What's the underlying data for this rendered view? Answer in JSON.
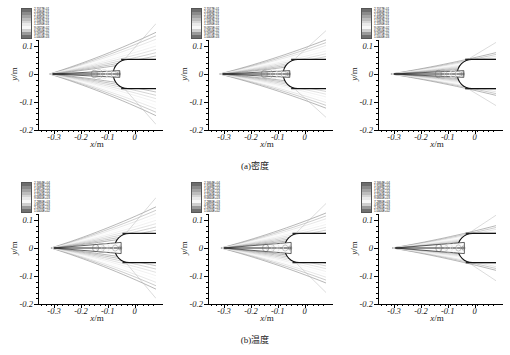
{
  "figure": {
    "width": 510,
    "height": 355,
    "background": "#ffffff"
  },
  "axes": {
    "xlabel_var": "x",
    "xlabel_unit": "/m",
    "ylabel_var": "y",
    "ylabel_unit": "/m",
    "xticks": [
      "-0.3",
      "-0.2",
      "-0.1",
      "0"
    ],
    "xtick_values": [
      -0.3,
      -0.2,
      -0.1,
      0
    ],
    "yticks": [
      "0.2",
      "0.1",
      "0",
      "-0.1",
      "-0.2"
    ],
    "ytick_values": [
      0.2,
      0.1,
      0,
      -0.1,
      -0.2
    ],
    "xlim": [
      -0.36,
      0.08
    ],
    "ylim": [
      -0.2,
      0.2
    ]
  },
  "rows": [
    {
      "id": "row-density",
      "caption": "(a)密度",
      "quantity": "density",
      "legend_levels": [
        "2.7077E-01",
        "2.4080E-01",
        "2.1082E-01",
        "1.8085E-01",
        "1.5087E-01",
        "1.2090E-01",
        "9.0925E-02",
        "6.0950E-02",
        "3.0975E-02",
        "1.0000E-03"
      ],
      "legend_values": [
        0.27077,
        0.2408,
        0.21082,
        0.18085,
        0.15087,
        0.1209,
        0.090925,
        0.06095,
        0.030975,
        0.001
      ]
    },
    {
      "id": "row-temperature",
      "caption": "(b)温度",
      "quantity": "temperature",
      "legend_levels": [
        "2.1664E+04",
        "1.9248E+04",
        "1.6872E+04",
        "1.4476E+04",
        "1.2080E+04",
        "9.6840E+03",
        "7.2880E+03",
        "4.8920E+03",
        "2.4960E+03",
        "1.0000E+02"
      ],
      "legend_values": [
        21664,
        19248,
        16872,
        14476,
        12080,
        9684,
        7288,
        4892,
        2496,
        100
      ]
    }
  ],
  "panels": [
    {
      "id": "panel-a1",
      "row": "density",
      "column": 1,
      "shock_spread": 1.0,
      "shock_tip_x": -0.305,
      "body_nose_x": -0.055
    },
    {
      "id": "panel-a2",
      "row": "density",
      "column": 2,
      "shock_spread": 0.82,
      "shock_tip_x": -0.305,
      "body_nose_x": -0.055
    },
    {
      "id": "panel-a3",
      "row": "density",
      "column": 3,
      "shock_spread": 0.52,
      "shock_tip_x": -0.3,
      "body_nose_x": -0.04
    },
    {
      "id": "panel-b1",
      "row": "temperature",
      "column": 1,
      "shock_spread": 1.0,
      "shock_tip_x": -0.3,
      "body_nose_x": -0.05
    },
    {
      "id": "panel-b2",
      "row": "temperature",
      "column": 2,
      "shock_spread": 0.85,
      "shock_tip_x": -0.3,
      "body_nose_x": -0.05
    },
    {
      "id": "panel-b3",
      "row": "temperature",
      "column": 3,
      "shock_spread": 0.55,
      "shock_tip_x": -0.295,
      "body_nose_x": -0.038
    }
  ],
  "colorbar_colors": [
    "#6d6d6d",
    "#8a8a8a",
    "#a3a3a3",
    "#bcbcbc",
    "#d4d4d4",
    "#e9e9e9",
    "#f7f7f7",
    "#cfcfcf",
    "#9a9a9a",
    "#707070"
  ],
  "chart_data": {
    "type": "contour",
    "title": "",
    "subtitle": "",
    "xlabel": "x/m",
    "ylabel": "y/m",
    "xlim": [
      -0.36,
      0.08
    ],
    "ylim": [
      -0.2,
      0.2
    ],
    "grid": false,
    "legend_position": "inside-top-left",
    "panel_grid": {
      "rows": 2,
      "columns": 3
    },
    "row_labels": [
      "(a)密度",
      "(b)温度"
    ],
    "series": [
      {
        "name": "(a)密度",
        "units": "kg/m^3",
        "contour_levels": [
          0.001,
          0.030975,
          0.06095,
          0.090925,
          0.1209,
          0.15087,
          0.18085,
          0.21082,
          0.2408,
          0.27077
        ],
        "level_labels": [
          "1.0000E-03",
          "3.0975E-02",
          "6.0950E-02",
          "9.0925E-02",
          "1.2090E-01",
          "1.5087E-01",
          "1.8085E-01",
          "2.1082E-01",
          "2.4080E-01",
          "2.7077E-01"
        ],
        "min": 0.001,
        "max": 0.27077
      },
      {
        "name": "(b)温度",
        "units": "K",
        "contour_levels": [
          100,
          2496,
          4892,
          7288,
          9684,
          12080,
          14476,
          16872,
          19248,
          21664
        ],
        "level_labels": [
          "1.0000E+02",
          "2.4960E+03",
          "4.8920E+03",
          "7.2880E+03",
          "9.6840E+03",
          "1.2080E+04",
          "1.4476E+04",
          "1.6872E+04",
          "1.9248E+04",
          "2.1664E+04"
        ],
        "min": 100,
        "max": 21664
      }
    ],
    "xticks": [
      -0.3,
      -0.2,
      -0.1,
      0
    ],
    "yticks": [
      -0.2,
      -0.1,
      0,
      0.1,
      0.2
    ]
  }
}
